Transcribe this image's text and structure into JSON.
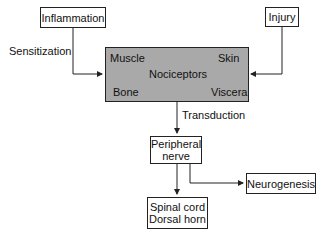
{
  "nodes": {
    "inflammation": "Inflammation",
    "injury": "Injury",
    "nociceptors": {
      "title": "Nociceptors",
      "muscle": "Muscle",
      "skin": "Skin",
      "bone": "Bone",
      "viscera": "Viscera"
    },
    "peripheral_nerve": [
      "Peripheral",
      "nerve"
    ],
    "neurogenesis": "Neurogenesis",
    "spinal_cord": [
      "Spinal cord",
      "Dorsal horn"
    ]
  },
  "edge_labels": {
    "sensitization": "Sensitization",
    "transduction": "Transduction"
  },
  "colors": {
    "nociceptor_fill": "#a9a9a9",
    "line": "#222222"
  }
}
